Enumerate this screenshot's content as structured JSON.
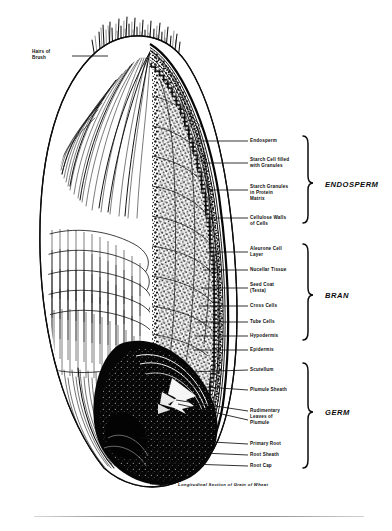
{
  "figure": {
    "caption": "Longitudinal Section of Grain of Wheat",
    "top_label": "Hairs of\nBrush"
  },
  "groups": [
    {
      "name": "ENDOSPERM",
      "label": "ENDOSPERM"
    },
    {
      "name": "BRAN",
      "label": "BRAN"
    },
    {
      "name": "GERM",
      "label": "GERM"
    }
  ],
  "callouts": {
    "endosperm": [
      {
        "label": "Endosperm"
      },
      {
        "label": "Starch Cell filled\nwith Granules"
      },
      {
        "label": "Starch Granules\nin Protein\nMatrix"
      },
      {
        "label": "Cellulose Walls\nof Cells"
      }
    ],
    "bran": [
      {
        "label": "Aleurone Cell\nLayer"
      },
      {
        "label": "Nucellar Tissue"
      },
      {
        "label": "Seed Coat\n(Testa)"
      },
      {
        "label": "Cross Cells"
      },
      {
        "label": "Tube Cells"
      },
      {
        "label": "Hypodermis"
      },
      {
        "label": "Epidermis"
      }
    ],
    "germ": [
      {
        "label": "Scutellum"
      },
      {
        "label": "Plumule Sheath"
      },
      {
        "label": "Rudimentary\nLeaves of\nPlumule"
      },
      {
        "label": "Primary Root"
      },
      {
        "label": "Root Sheath"
      },
      {
        "label": "Root Cap"
      }
    ]
  },
  "colors": {
    "ink": "#0d0d0d",
    "paper": "#ffffff",
    "rule": "#9a9a9a"
  }
}
